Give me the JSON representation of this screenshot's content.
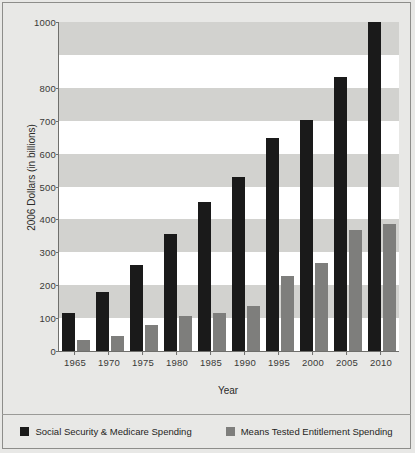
{
  "chart_data": {
    "type": "bar",
    "title": "",
    "xlabel": "Year",
    "ylabel": "2006 Dollars (in billions)",
    "categories": [
      "1965",
      "1970",
      "1975",
      "1980",
      "1985",
      "1990",
      "1995",
      "2000",
      "2005",
      "2010"
    ],
    "series": [
      {
        "name": "Social Security & Medicare Spending",
        "color": "#1a1a1a",
        "values": [
          115,
          180,
          262,
          357,
          453,
          530,
          648,
          703,
          832,
          1000
        ]
      },
      {
        "name": "Means Tested Entitlement Spending",
        "color": "#7e7e7c",
        "values": [
          35,
          47,
          80,
          105,
          117,
          137,
          228,
          267,
          367,
          385
        ]
      }
    ],
    "ylim": [
      0,
      1000
    ],
    "ytick_labels": [
      "1000",
      "800",
      "700",
      "600",
      "500",
      "400",
      "300",
      "200",
      "100",
      "0"
    ],
    "ytick_values": [
      1000,
      800,
      700,
      600,
      500,
      400,
      300,
      200,
      100,
      0
    ],
    "grid": "horizontal-banded",
    "legend_position": "bottom",
    "plot_background": "#ffffff",
    "band_color": "#d2d2cf",
    "figure_background": "#e8e8e6"
  }
}
